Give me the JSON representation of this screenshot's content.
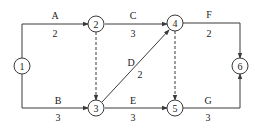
{
  "diagram": {
    "type": "activity-network",
    "nodes": [
      {
        "id": "1",
        "label": "1"
      },
      {
        "id": "2",
        "label": "2"
      },
      {
        "id": "3",
        "label": "3"
      },
      {
        "id": "4",
        "label": "4"
      },
      {
        "id": "5",
        "label": "5"
      },
      {
        "id": "6",
        "label": "6"
      }
    ],
    "edges": [
      {
        "from": "1",
        "to": "2",
        "name": "A",
        "duration": "2",
        "dummy": false
      },
      {
        "from": "1",
        "to": "3",
        "name": "B",
        "duration": "3",
        "dummy": false
      },
      {
        "from": "2",
        "to": "4",
        "name": "C",
        "duration": "3",
        "dummy": false
      },
      {
        "from": "3",
        "to": "4",
        "name": "D",
        "duration": "2",
        "dummy": false
      },
      {
        "from": "3",
        "to": "5",
        "name": "E",
        "duration": "3",
        "dummy": false
      },
      {
        "from": "4",
        "to": "6",
        "name": "F",
        "duration": "2",
        "dummy": false
      },
      {
        "from": "5",
        "to": "6",
        "name": "G",
        "duration": "3",
        "dummy": false
      },
      {
        "from": "2",
        "to": "3",
        "name": "",
        "duration": "",
        "dummy": true
      },
      {
        "from": "4",
        "to": "5",
        "name": "",
        "duration": "",
        "dummy": true
      }
    ]
  }
}
